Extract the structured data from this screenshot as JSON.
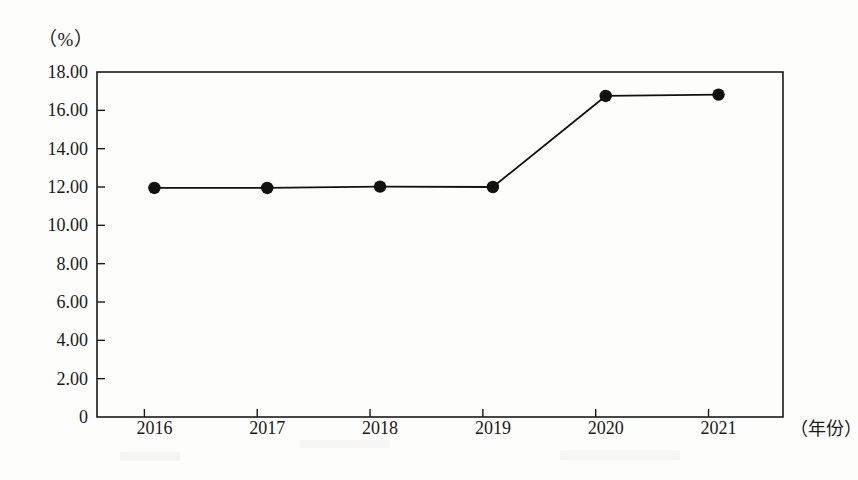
{
  "chart_data": {
    "type": "line",
    "title": "",
    "subtitle": "",
    "xlabel": "（年份）",
    "ylabel": "（%）",
    "categories": [
      "2016",
      "2017",
      "2018",
      "2019",
      "2020",
      "2021"
    ],
    "values": [
      11.95,
      11.95,
      12.02,
      12.0,
      16.75,
      16.82
    ],
    "series": [
      {
        "name": "",
        "values": [
          11.95,
          11.95,
          12.02,
          12.0,
          16.75,
          16.82
        ]
      }
    ],
    "ylim": [
      0,
      18
    ],
    "ytick_labels": [
      "18.00",
      "16.00",
      "14.00",
      "12.00",
      "10.00",
      "8.00",
      "6.00",
      "4.00",
      "2.00",
      "0"
    ],
    "ytick_values": [
      18,
      16,
      14,
      12,
      10,
      8,
      6,
      4,
      2,
      0
    ],
    "xtick_labels": [
      "2016",
      "2017",
      "2018",
      "2019",
      "2020",
      "2021"
    ],
    "grid": false,
    "legend": false,
    "legend_position": "none",
    "marker": "filled-circle",
    "line_color": "#111111",
    "marker_color": "#111111",
    "axis_color": "#1a1a1a",
    "background_color": "#fdfdfb"
  }
}
